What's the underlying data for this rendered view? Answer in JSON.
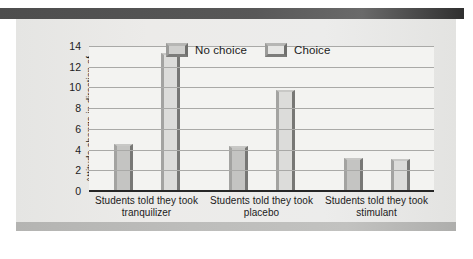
{
  "figure": {
    "background_color": "#e9e9e7",
    "plot_background_color": "#f3f3f1"
  },
  "legend": {
    "items": [
      {
        "label": "No choice",
        "color": "#c4c4c2",
        "swatch_name": "legend-swatch-no-choice"
      },
      {
        "label": "Choice",
        "color": "#dcdcda",
        "swatch_name": "legend-swatch-choice"
      }
    ]
  },
  "axes": {
    "y_title": "Attitude change in direction of counter-attitudinal actions",
    "y_ticks": [
      "14",
      "12",
      "10",
      "8",
      "6",
      "4",
      "2",
      "0"
    ]
  },
  "chart_data": {
    "type": "bar",
    "title": "",
    "subtitle": "",
    "xlabel": "",
    "ylabel": "Attitude change in direction of counter-attitudinal actions",
    "categories": [
      "Students told they took tranquilizer",
      "Students told they took placebo",
      "Students told they took stimulant"
    ],
    "series": [
      {
        "name": "No choice",
        "color": "#c4c4c2",
        "values": [
          4.5,
          4.3,
          3.2
        ]
      },
      {
        "name": "Choice",
        "color": "#dcdcda",
        "values": [
          13.3,
          9.8,
          3.1
        ]
      }
    ],
    "ylim": [
      0,
      14
    ],
    "ytick_step": 2,
    "grid": true,
    "grid_axis": "y",
    "legend_position": "top-center",
    "orientation": "vertical",
    "bar_style": "3d-beveled"
  }
}
